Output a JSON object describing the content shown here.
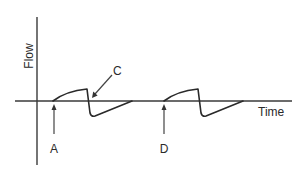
{
  "diagram": {
    "axes": {
      "y_label": "Flow",
      "x_label": "Time"
    },
    "annotations": {
      "a": "A",
      "c": "C",
      "d": "D"
    }
  }
}
